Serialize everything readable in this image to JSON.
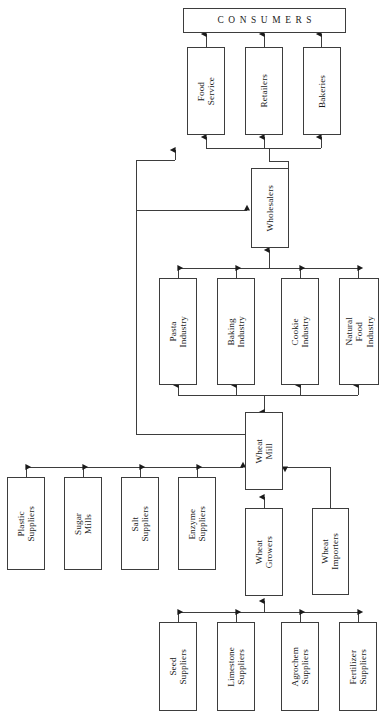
{
  "diagram": {
    "type": "flow-diagram",
    "stroke_color": "#3d3d3d",
    "background_color": "#ffffff",
    "nodes": [
      {
        "id": "consumers",
        "label": "CONSUMERS",
        "tier": "consumers"
      },
      {
        "id": "food_service",
        "label": "Food\nService",
        "tier": "distribution"
      },
      {
        "id": "retailers",
        "label": "Retailers",
        "tier": "distribution"
      },
      {
        "id": "bakeries",
        "label": "Bakeries",
        "tier": "distribution"
      },
      {
        "id": "wholesalers",
        "label": "Wholesalers",
        "tier": "wholesale"
      },
      {
        "id": "pasta",
        "label": "Pasta\nIndustry",
        "tier": "industry"
      },
      {
        "id": "baking",
        "label": "Baking\nIndustry",
        "tier": "industry"
      },
      {
        "id": "cookie",
        "label": "Cookie\nIndustry",
        "tier": "industry"
      },
      {
        "id": "natural",
        "label": "Natural\nFood\nIndustry",
        "tier": "industry"
      },
      {
        "id": "wheat_mill",
        "label": "Wheat\nMill",
        "tier": "processing"
      },
      {
        "id": "plastic",
        "label": "Plastic\nSuppliers",
        "tier": "input-suppliers"
      },
      {
        "id": "sugar",
        "label": "Sugar\nMills",
        "tier": "input-suppliers"
      },
      {
        "id": "salt",
        "label": "Salt\nSuppliers",
        "tier": "input-suppliers"
      },
      {
        "id": "enzyme",
        "label": "Enzyme\nSuppliers",
        "tier": "input-suppliers"
      },
      {
        "id": "growers",
        "label": "Wheat\nGrowers",
        "tier": "farm"
      },
      {
        "id": "importers",
        "label": "Wheat\nImporters",
        "tier": "farm"
      },
      {
        "id": "seed",
        "label": "Seed\nSuppliers",
        "tier": "farm-suppliers"
      },
      {
        "id": "limestone",
        "label": "Limestone\nSuppliers",
        "tier": "farm-suppliers"
      },
      {
        "id": "agrochem",
        "label": "Agrochem\nSuppliers",
        "tier": "farm-suppliers"
      },
      {
        "id": "fertilizer",
        "label": "Fertilizer\nSuppliers",
        "tier": "farm-suppliers"
      }
    ],
    "edges": [
      {
        "from": "food_service",
        "to": "consumers"
      },
      {
        "from": "retailers",
        "to": "consumers"
      },
      {
        "from": "bakeries",
        "to": "consumers"
      },
      {
        "from": "wholesalers",
        "to": "food_service"
      },
      {
        "from": "wholesalers",
        "to": "retailers"
      },
      {
        "from": "wholesalers",
        "to": "bakeries"
      },
      {
        "from": "pasta",
        "to": "wholesalers"
      },
      {
        "from": "baking",
        "to": "wholesalers"
      },
      {
        "from": "cookie",
        "to": "wholesalers"
      },
      {
        "from": "natural",
        "to": "wholesalers"
      },
      {
        "from": "wheat_mill",
        "to": "pasta"
      },
      {
        "from": "wheat_mill",
        "to": "baking"
      },
      {
        "from": "wheat_mill",
        "to": "cookie"
      },
      {
        "from": "wheat_mill",
        "to": "natural"
      },
      {
        "from": "wheat_mill",
        "to": "food_service"
      },
      {
        "from": "plastic",
        "to": "wheat_mill"
      },
      {
        "from": "sugar",
        "to": "wheat_mill"
      },
      {
        "from": "salt",
        "to": "wheat_mill"
      },
      {
        "from": "enzyme",
        "to": "wheat_mill"
      },
      {
        "from": "growers",
        "to": "wheat_mill"
      },
      {
        "from": "importers",
        "to": "wheat_mill"
      },
      {
        "from": "seed",
        "to": "growers"
      },
      {
        "from": "limestone",
        "to": "growers"
      },
      {
        "from": "agrochem",
        "to": "growers"
      },
      {
        "from": "fertilizer",
        "to": "growers"
      }
    ]
  }
}
